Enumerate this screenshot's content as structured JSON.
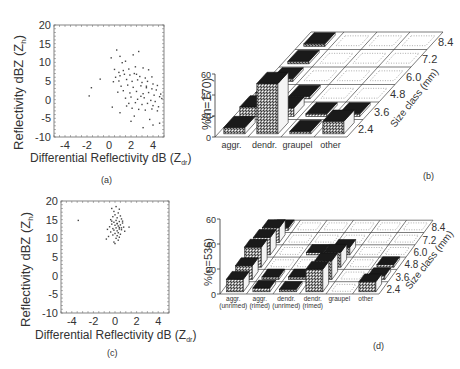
{
  "panels": {
    "a": {
      "caption": "(a)",
      "xlabel": "Differential Reflectivity dB (Z",
      "xlabel_sub": "dr",
      "xlabel_close": ")",
      "ylabel": "Reflectivity dBZ (Z",
      "ylabel_sub": "h",
      "ylabel_close": ")",
      "xticks": [
        "-4",
        "-2",
        "0",
        "2",
        "4"
      ],
      "yticks": [
        "20",
        "15",
        "10",
        "5",
        "0",
        "-5",
        "-10"
      ]
    },
    "b": {
      "caption": "(b)",
      "ylabel": "%(n=170)",
      "zlabel": "Size class (mm)",
      "yticks": [
        "60",
        "40",
        "20",
        "0"
      ],
      "categories": [
        "aggr.",
        "dendr.",
        "graupel",
        "other"
      ],
      "size_classes": [
        "2.4",
        "3.6",
        "4.8",
        "6.0",
        "7.2",
        "8.4"
      ]
    },
    "c": {
      "caption": "(c)",
      "xlabel": "Differential Reflectivity dB (Z",
      "xlabel_sub": "dr",
      "xlabel_close": ")",
      "ylabel": "Reflectivity dBZ (Z",
      "ylabel_sub": "h",
      "ylabel_close": ")",
      "xticks": [
        "-4",
        "-2",
        "0",
        "2",
        "4"
      ],
      "yticks": [
        "20",
        "15",
        "10",
        "5",
        "0",
        "-5",
        "-10"
      ]
    },
    "d": {
      "caption": "(d)",
      "ylabel": "%(n=536)",
      "zlabel": "Size class (mm)",
      "yticks": [
        "60",
        "40",
        "20",
        "0"
      ],
      "categories": [
        [
          "aggr.",
          "(unrimed)"
        ],
        [
          "aggr.",
          "(rimed)"
        ],
        [
          "dendr.",
          "(unrimed)"
        ],
        [
          "dendr.",
          "(rimed)"
        ],
        [
          "graupel",
          ""
        ],
        [
          "other",
          ""
        ]
      ],
      "size_classes": [
        "2.4",
        "3.6",
        "4.8",
        "6.0",
        "7.2",
        "8.4"
      ]
    }
  },
  "chart_data": [
    {
      "panel": "a",
      "type": "scatter",
      "title": "",
      "xlabel": "Differential Reflectivity dB (Zdr)",
      "ylabel": "Reflectivity dBZ (Zh)",
      "xlim": [
        -5,
        5
      ],
      "ylim": [
        -10,
        20
      ],
      "grid": false,
      "points": [
        [
          -0.8,
          5.5
        ],
        [
          -1.6,
          3.2
        ],
        [
          -1.8,
          1.0
        ],
        [
          0.2,
          11.2
        ],
        [
          0.7,
          13.3
        ],
        [
          1.0,
          11.6
        ],
        [
          1.5,
          10.3
        ],
        [
          2.2,
          12.0
        ],
        [
          2.7,
          12.9
        ],
        [
          1.2,
          9.9
        ],
        [
          0.5,
          8.1
        ],
        [
          0.9,
          7.3
        ],
        [
          1.3,
          7.8
        ],
        [
          1.8,
          8.2
        ],
        [
          2.4,
          8.8
        ],
        [
          3.1,
          8.5
        ],
        [
          3.6,
          8.0
        ],
        [
          0.6,
          6.0
        ],
        [
          1.0,
          6.4
        ],
        [
          1.4,
          6.8
        ],
        [
          1.9,
          6.6
        ],
        [
          2.3,
          7.0
        ],
        [
          2.8,
          6.2
        ],
        [
          3.3,
          5.8
        ],
        [
          3.9,
          6.1
        ],
        [
          0.4,
          4.8
        ],
        [
          0.9,
          5.0
        ],
        [
          1.6,
          5.4
        ],
        [
          2.1,
          4.9
        ],
        [
          2.6,
          5.3
        ],
        [
          3.0,
          4.6
        ],
        [
          3.5,
          4.9
        ],
        [
          4.0,
          4.2
        ],
        [
          4.4,
          3.8
        ],
        [
          1.1,
          3.6
        ],
        [
          1.7,
          3.9
        ],
        [
          2.2,
          3.3
        ],
        [
          2.9,
          3.7
        ],
        [
          3.4,
          3.2
        ],
        [
          3.9,
          2.9
        ],
        [
          4.3,
          2.6
        ],
        [
          4.7,
          1.5
        ],
        [
          0.8,
          2.0
        ],
        [
          1.3,
          2.4
        ],
        [
          1.9,
          1.8
        ],
        [
          2.5,
          2.2
        ],
        [
          3.1,
          1.6
        ],
        [
          3.6,
          1.9
        ],
        [
          4.1,
          1.2
        ],
        [
          4.6,
          0.8
        ],
        [
          1.5,
          0.4
        ],
        [
          2.0,
          0.7
        ],
        [
          2.6,
          0.1
        ],
        [
          3.2,
          0.5
        ],
        [
          3.8,
          -0.2
        ],
        [
          4.2,
          -0.5
        ],
        [
          4.8,
          0.3
        ],
        [
          1.8,
          -1.0
        ],
        [
          2.4,
          -0.8
        ],
        [
          3.0,
          -1.3
        ],
        [
          3.5,
          -1.0
        ],
        [
          4.0,
          -1.6
        ],
        [
          4.5,
          -1.9
        ],
        [
          2.1,
          -2.3
        ],
        [
          2.7,
          -2.6
        ],
        [
          3.3,
          -2.8
        ],
        [
          3.9,
          -2.5
        ],
        [
          4.4,
          -3.0
        ],
        [
          0.3,
          -2.0
        ],
        [
          1.0,
          -3.5
        ],
        [
          2.3,
          -4.4
        ],
        [
          3.7,
          -5.3
        ],
        [
          2.0,
          -5.8
        ],
        [
          4.6,
          -6.3
        ],
        [
          3.1,
          -7.5
        ],
        [
          4.0,
          -6.8
        ],
        [
          1.6,
          -1.7
        ],
        [
          2.9,
          0.9
        ],
        [
          3.4,
          3.6
        ],
        [
          2.5,
          6.8
        ]
      ]
    },
    {
      "panel": "b",
      "type": "bar",
      "title": "",
      "xlabel": "",
      "ylabel": "%(n=170)",
      "zlabel": "Size class (mm)",
      "ylim": [
        0,
        60
      ],
      "categories": [
        "aggr.",
        "dendr.",
        "graupel",
        "other"
      ],
      "size_classes": [
        "2.4",
        "3.6",
        "4.8",
        "6.0",
        "7.2",
        "8.4"
      ],
      "series": [
        {
          "name": "aggr.",
          "values": [
            6,
            9,
            6,
            1,
            1,
            1
          ]
        },
        {
          "name": "dendr.",
          "values": [
            48,
            8,
            1,
            0,
            0,
            0
          ]
        },
        {
          "name": "graupel",
          "values": [
            1,
            0.5,
            0,
            0,
            0,
            0
          ]
        },
        {
          "name": "other",
          "values": [
            12,
            2,
            0,
            0,
            0,
            0
          ]
        }
      ]
    },
    {
      "panel": "c",
      "type": "scatter",
      "title": "",
      "xlabel": "Differential Reflectivity dB (Zdr)",
      "ylabel": "Reflectivity dBZ (Zh)",
      "xlim": [
        -5,
        5
      ],
      "ylim": [
        -10,
        20
      ],
      "grid": false,
      "points": [
        [
          -3.4,
          14.8
        ],
        [
          -0.3,
          18.0
        ],
        [
          0.1,
          18.5
        ],
        [
          0.4,
          17.8
        ],
        [
          -0.1,
          17.2
        ],
        [
          0.3,
          16.8
        ],
        [
          0.0,
          16.3
        ],
        [
          0.5,
          16.0
        ],
        [
          -0.2,
          15.8
        ],
        [
          0.2,
          15.5
        ],
        [
          0.6,
          15.2
        ],
        [
          -0.4,
          15.0
        ],
        [
          0.1,
          14.8
        ],
        [
          0.4,
          14.5
        ],
        [
          -0.1,
          14.3
        ],
        [
          0.7,
          14.1
        ],
        [
          0.2,
          14.0
        ],
        [
          -0.3,
          13.8
        ],
        [
          0.5,
          13.6
        ],
        [
          0.0,
          13.5
        ],
        [
          0.3,
          13.3
        ],
        [
          -0.5,
          13.1
        ],
        [
          0.8,
          13.0
        ],
        [
          0.1,
          12.8
        ],
        [
          -0.2,
          12.6
        ],
        [
          0.4,
          12.5
        ],
        [
          0.6,
          12.3
        ],
        [
          -0.1,
          12.2
        ],
        [
          0.2,
          12.0
        ],
        [
          0.9,
          11.9
        ],
        [
          -0.4,
          11.7
        ],
        [
          0.3,
          11.5
        ],
        [
          0.0,
          11.3
        ],
        [
          0.5,
          11.1
        ],
        [
          -0.2,
          10.9
        ],
        [
          0.2,
          10.7
        ],
        [
          -0.6,
          10.5
        ],
        [
          0.4,
          10.3
        ],
        [
          0.1,
          10.0
        ],
        [
          -0.8,
          9.8
        ],
        [
          0.3,
          9.5
        ],
        [
          -0.1,
          9.0
        ],
        [
          0.6,
          12.8
        ],
        [
          1.3,
          13.0
        ],
        [
          -0.7,
          12.4
        ],
        [
          0.7,
          14.6
        ],
        [
          0.0,
          8.6
        ],
        [
          0.2,
          13.9
        ],
        [
          -0.3,
          14.6
        ],
        [
          0.4,
          12.9
        ]
      ]
    },
    {
      "panel": "d",
      "type": "bar",
      "title": "",
      "xlabel": "",
      "ylabel": "%(n=536)",
      "zlabel": "Size class (mm)",
      "ylim": [
        0,
        60
      ],
      "categories": [
        "aggr. (unrimed)",
        "aggr. (rimed)",
        "dendr. (unrimed)",
        "dendr. (rimed)",
        "graupel",
        "other"
      ],
      "size_classes": [
        "2.4",
        "3.6",
        "4.8",
        "6.0",
        "7.2",
        "8.4"
      ],
      "series": [
        {
          "name": "aggr. (unrimed)",
          "values": [
            10,
            11,
            16,
            14,
            12,
            1
          ]
        },
        {
          "name": "aggr. (rimed)",
          "values": [
            3,
            1,
            0,
            0,
            0,
            0
          ]
        },
        {
          "name": "dendr. (unrimed)",
          "values": [
            1,
            1,
            0,
            1,
            0,
            0
          ]
        },
        {
          "name": "dendr. (rimed)",
          "values": [
            18,
            15,
            12,
            6,
            0,
            0
          ]
        },
        {
          "name": "graupel",
          "values": [
            0,
            0,
            0,
            0,
            0,
            0
          ]
        },
        {
          "name": "other",
          "values": [
            8,
            3,
            1,
            0,
            0,
            0
          ]
        }
      ]
    }
  ]
}
